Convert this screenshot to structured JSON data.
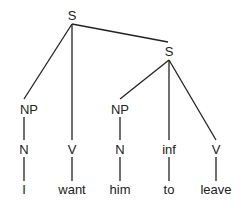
{
  "tree": {
    "nodes": {
      "root_s": {
        "label": "S",
        "x": 72,
        "y": 15
      },
      "sub_s": {
        "label": "S",
        "x": 169,
        "y": 51
      },
      "np1": {
        "label": "NP",
        "x": 29,
        "y": 109
      },
      "n1": {
        "label": "N",
        "x": 24,
        "y": 149
      },
      "word_i": {
        "label": "I",
        "x": 24,
        "y": 189
      },
      "v1": {
        "label": "V",
        "x": 72,
        "y": 149
      },
      "word_want": {
        "label": "want",
        "x": 72,
        "y": 189
      },
      "np2": {
        "label": "NP",
        "x": 120,
        "y": 109
      },
      "n2": {
        "label": "N",
        "x": 120,
        "y": 149
      },
      "word_him": {
        "label": "him",
        "x": 120,
        "y": 189
      },
      "inf": {
        "label": "inf",
        "x": 169,
        "y": 149
      },
      "word_to": {
        "label": "to",
        "x": 169,
        "y": 189
      },
      "v2": {
        "label": "V",
        "x": 216,
        "y": 149
      },
      "word_leave": {
        "label": "leave",
        "x": 216,
        "y": 189
      }
    },
    "line_color": "#222222"
  }
}
